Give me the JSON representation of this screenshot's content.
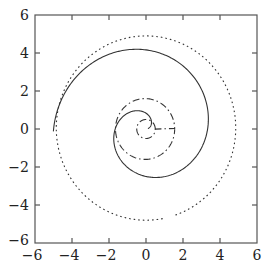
{
  "chart_data": {
    "type": "line",
    "title": "",
    "xlabel": "",
    "ylabel": "",
    "xlim": [
      -6,
      6
    ],
    "ylim": [
      -6,
      6
    ],
    "grid": false,
    "legend": null,
    "x_ticks": [
      -6,
      -4,
      -2,
      0,
      2,
      4,
      6
    ],
    "y_ticks": [
      -6,
      -4,
      -2,
      0,
      2,
      4,
      6
    ],
    "x_tick_labels": [
      "−6",
      "−4",
      "−2",
      "0",
      "2",
      "4",
      "6"
    ],
    "y_tick_labels": [
      "−6",
      "−4",
      "−2",
      "0",
      "2",
      "4",
      "6"
    ],
    "series": [
      {
        "name": "dotted-circle",
        "style": "dotted",
        "description": "Near-circular curve of radius about 5 centred at origin",
        "param": {
          "kind": "spiral",
          "r0": 4.85,
          "k": 0.0,
          "theta_start": 5.05,
          "theta_end": 11.2
        }
      },
      {
        "name": "solid-spiral",
        "style": "solid",
        "description": "Spiral from near the centre winding outward two turns, ending near (3.8, -2.8)",
        "param": {
          "kind": "spiral",
          "r0": 0.0,
          "k": 0.53,
          "theta_start": 0.2,
          "theta_end": 9.45
        }
      },
      {
        "name": "dashdot-spiral",
        "style": "dashdot",
        "description": "Small inner loop radius ~0.5 joined to a larger loop radius ~1.6 around the centre",
        "param": {
          "kind": "spiral",
          "r0": 0.45,
          "k": 0.09,
          "theta_start": 0.0,
          "theta_end": 12.8
        }
      }
    ],
    "sample_points": {
      "solid-spiral": [
        [
          0.9,
          0.2
        ],
        [
          0.0,
          1.5
        ],
        [
          -2.2,
          0.0
        ],
        [
          0.0,
          -2.6
        ],
        [
          3.3,
          0.0
        ],
        [
          0.0,
          4.2
        ],
        [
          -4.5,
          0.0
        ],
        [
          0.0,
          -4.7
        ],
        [
          3.8,
          -2.8
        ]
      ],
      "dotted-circle": [
        [
          4.9,
          0.0
        ],
        [
          0.0,
          4.9
        ],
        [
          -4.9,
          0.0
        ],
        [
          0.0,
          -4.9
        ]
      ],
      "dashdot-spiral": [
        [
          0.5,
          0.0
        ],
        [
          0.0,
          0.5
        ],
        [
          -0.5,
          0.0
        ],
        [
          1.6,
          0.0
        ],
        [
          0.0,
          1.6
        ],
        [
          -1.6,
          0.0
        ],
        [
          0.0,
          -1.6
        ]
      ]
    }
  }
}
